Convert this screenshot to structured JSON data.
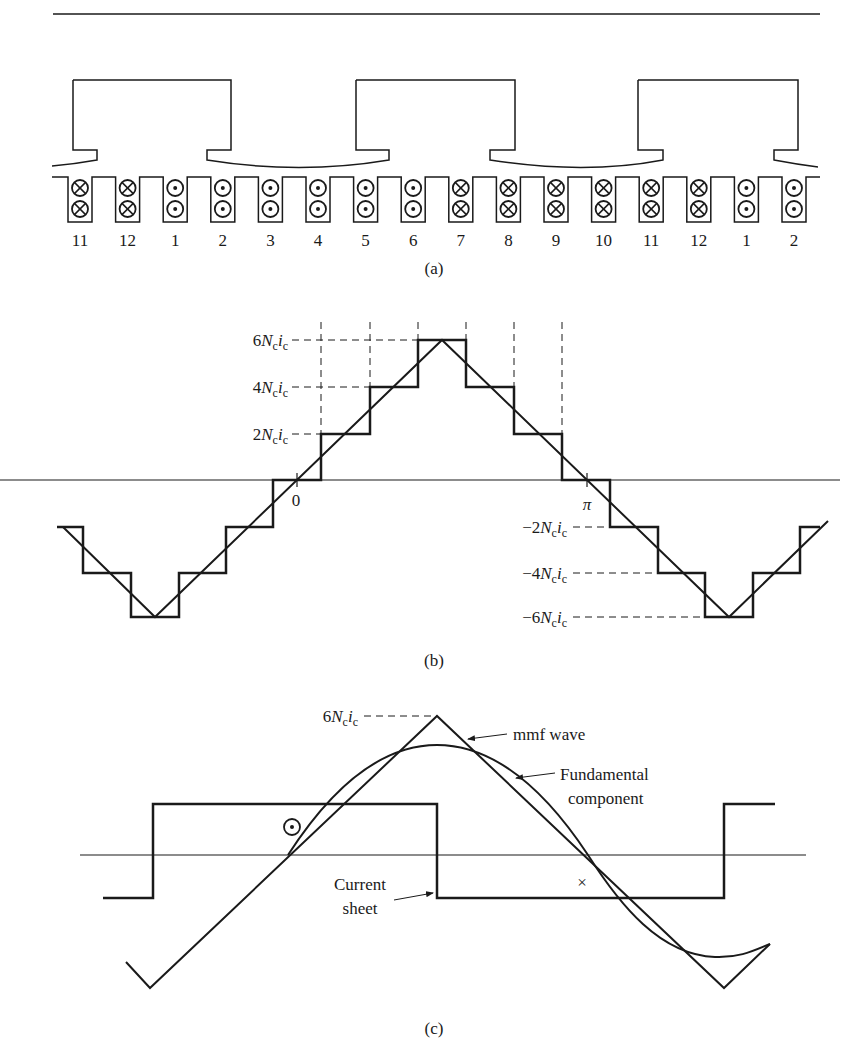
{
  "figure": {
    "panel_a": {
      "caption": "(a)",
      "slot_labels": [
        "11",
        "12",
        "1",
        "2",
        "3",
        "4",
        "5",
        "6",
        "7",
        "8",
        "9",
        "10",
        "11",
        "12",
        "1",
        "2"
      ],
      "slot_conductors": [
        "cross",
        "cross",
        "dot",
        "dot",
        "dot",
        "dot",
        "dot",
        "dot",
        "cross",
        "cross",
        "cross",
        "cross",
        "cross",
        "cross",
        "dot",
        "dot"
      ]
    },
    "panel_b": {
      "caption": "(b)",
      "y_labels_positive": [
        "6N_c i_c",
        "4N_c i_c",
        "2N_c i_c"
      ],
      "y_labels_negative": [
        "−2N_c i_c",
        "−4N_c i_c",
        "−6N_c i_c"
      ],
      "x_labels": [
        "0",
        "π"
      ]
    },
    "panel_c": {
      "caption": "(c)",
      "peak_label": "6N_c i_c",
      "annotations": {
        "mmf_wave": "mmf wave",
        "fundamental_1": "Fundamental",
        "fundamental_2": "component",
        "current_sheet_1": "Current",
        "current_sheet_2": "sheet"
      },
      "symbols": {
        "out_of_page": "dot",
        "into_page": "×"
      }
    }
  },
  "chart_data": {
    "type": "line",
    "xlabel": "electrical angle",
    "ylabel": "mmf",
    "x_ticks": [
      "0",
      "π"
    ],
    "y_ticks": [
      "-6N_c i_c",
      "-4N_c i_c",
      "-2N_c i_c",
      "2N_c i_c",
      "4N_c i_c",
      "6N_c i_c"
    ],
    "series": [
      {
        "name": "stepped mmf",
        "levels_in_Nc_ic": [
          -6,
          -4,
          -2,
          0,
          2,
          4,
          6,
          4,
          2,
          0,
          -2,
          -4,
          -6,
          -4,
          -2
        ]
      },
      {
        "name": "mmf wave (triangle)",
        "peak": 6
      },
      {
        "name": "fundamental component",
        "shape": "sinusoid"
      }
    ]
  }
}
